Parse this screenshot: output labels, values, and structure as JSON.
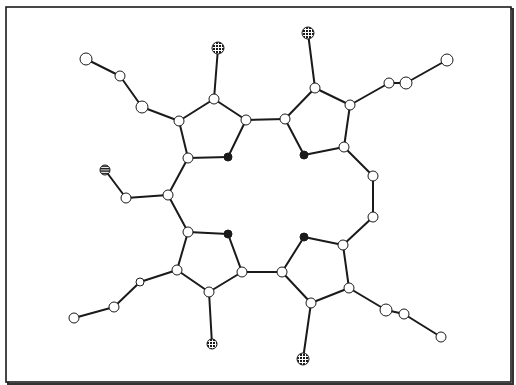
{
  "diagram": {
    "type": "molecular-structure",
    "frame": {
      "x": 6,
      "y": 7,
      "width": 505,
      "height": 375,
      "stroke": "#1a1a1a",
      "shadow": "#333333"
    },
    "styles": {
      "bond_color": "#1a1a1a",
      "bond_width": 2,
      "node_stroke": "#1a1a1a",
      "open_fill": "#ffffff",
      "black_fill": "#1a1a1a",
      "dotted_fill": "#1a1a1a",
      "striped_fill": "#1a1a1a"
    },
    "legend_types": {
      "open": "open-circle atom",
      "black": "solid black atom (nitrogen)",
      "dotted": "dotted/stippled atom",
      "striped": "horizontally striped atom"
    },
    "nodes": [
      {
        "id": "n1",
        "x": 86,
        "y": 59,
        "r": 6,
        "type": "open"
      },
      {
        "id": "n2",
        "x": 120,
        "y": 76,
        "r": 5,
        "type": "open"
      },
      {
        "id": "n3",
        "x": 142,
        "y": 107,
        "r": 6,
        "type": "open"
      },
      {
        "id": "n4",
        "x": 179,
        "y": 121,
        "r": 5,
        "type": "open"
      },
      {
        "id": "n5",
        "x": 214,
        "y": 99,
        "r": 5,
        "type": "open"
      },
      {
        "id": "n6",
        "x": 218,
        "y": 48,
        "r": 6,
        "type": "dotted"
      },
      {
        "id": "n7",
        "x": 246,
        "y": 120,
        "r": 5,
        "type": "open"
      },
      {
        "id": "n8",
        "x": 188,
        "y": 158,
        "r": 5,
        "type": "open"
      },
      {
        "id": "n9",
        "x": 228,
        "y": 157,
        "r": 4,
        "type": "black"
      },
      {
        "id": "n10",
        "x": 308,
        "y": 33,
        "r": 6,
        "type": "dotted"
      },
      {
        "id": "n11",
        "x": 315,
        "y": 88,
        "r": 5,
        "type": "open"
      },
      {
        "id": "n12",
        "x": 350,
        "y": 105,
        "r": 5,
        "type": "open"
      },
      {
        "id": "n13",
        "x": 389,
        "y": 83,
        "r": 5,
        "type": "open"
      },
      {
        "id": "n14",
        "x": 406,
        "y": 83,
        "r": 6,
        "type": "open"
      },
      {
        "id": "n15",
        "x": 447,
        "y": 60,
        "r": 6,
        "type": "open"
      },
      {
        "id": "n16",
        "x": 285,
        "y": 119,
        "r": 5,
        "type": "open"
      },
      {
        "id": "n17",
        "x": 304,
        "y": 155,
        "r": 4,
        "type": "black"
      },
      {
        "id": "n18",
        "x": 344,
        "y": 147,
        "r": 5,
        "type": "open"
      },
      {
        "id": "n19",
        "x": 373,
        "y": 176,
        "r": 5,
        "type": "open"
      },
      {
        "id": "n20",
        "x": 373,
        "y": 217,
        "r": 5,
        "type": "open"
      },
      {
        "id": "n21",
        "x": 105,
        "y": 170,
        "r": 5,
        "type": "striped"
      },
      {
        "id": "n22",
        "x": 126,
        "y": 198,
        "r": 5,
        "type": "open"
      },
      {
        "id": "n23",
        "x": 168,
        "y": 195,
        "r": 5,
        "type": "open"
      },
      {
        "id": "n24",
        "x": 188,
        "y": 232,
        "r": 5,
        "type": "open"
      },
      {
        "id": "n25",
        "x": 228,
        "y": 234,
        "r": 4,
        "type": "black"
      },
      {
        "id": "n26",
        "x": 242,
        "y": 272,
        "r": 5,
        "type": "open"
      },
      {
        "id": "n27",
        "x": 209,
        "y": 292,
        "r": 5,
        "type": "open"
      },
      {
        "id": "n28",
        "x": 177,
        "y": 270,
        "r": 5,
        "type": "open"
      },
      {
        "id": "n29",
        "x": 140,
        "y": 282,
        "r": 4,
        "type": "open"
      },
      {
        "id": "n30",
        "x": 114,
        "y": 307,
        "r": 5,
        "type": "open"
      },
      {
        "id": "n31",
        "x": 74,
        "y": 318,
        "r": 5,
        "type": "open"
      },
      {
        "id": "n32",
        "x": 212,
        "y": 344,
        "r": 5,
        "type": "dotted"
      },
      {
        "id": "n33",
        "x": 304,
        "y": 237,
        "r": 4,
        "type": "black"
      },
      {
        "id": "n34",
        "x": 343,
        "y": 245,
        "r": 5,
        "type": "open"
      },
      {
        "id": "n35",
        "x": 282,
        "y": 272,
        "r": 5,
        "type": "open"
      },
      {
        "id": "n36",
        "x": 311,
        "y": 303,
        "r": 5,
        "type": "open"
      },
      {
        "id": "n37",
        "x": 349,
        "y": 288,
        "r": 5,
        "type": "open"
      },
      {
        "id": "n38",
        "x": 386,
        "y": 310,
        "r": 6,
        "type": "open"
      },
      {
        "id": "n39",
        "x": 404,
        "y": 314,
        "r": 5,
        "type": "open"
      },
      {
        "id": "n40",
        "x": 441,
        "y": 337,
        "r": 5,
        "type": "open"
      },
      {
        "id": "n41",
        "x": 303,
        "y": 359,
        "r": 6,
        "type": "dotted"
      }
    ],
    "bonds": [
      [
        "n1",
        "n2"
      ],
      [
        "n2",
        "n3"
      ],
      [
        "n3",
        "n4"
      ],
      [
        "n4",
        "n5"
      ],
      [
        "n5",
        "n6"
      ],
      [
        "n5",
        "n7"
      ],
      [
        "n7",
        "n9"
      ],
      [
        "n9",
        "n8"
      ],
      [
        "n8",
        "n4"
      ],
      [
        "n7",
        "n16"
      ],
      [
        "n16",
        "n11"
      ],
      [
        "n11",
        "n10"
      ],
      [
        "n11",
        "n12"
      ],
      [
        "n12",
        "n13"
      ],
      [
        "n13",
        "n14"
      ],
      [
        "n14",
        "n15"
      ],
      [
        "n12",
        "n18"
      ],
      [
        "n18",
        "n17"
      ],
      [
        "n17",
        "n16"
      ],
      [
        "n18",
        "n19"
      ],
      [
        "n19",
        "n20"
      ],
      [
        "n20",
        "n34"
      ],
      [
        "n8",
        "n23"
      ],
      [
        "n23",
        "n22"
      ],
      [
        "n22",
        "n21"
      ],
      [
        "n23",
        "n24"
      ],
      [
        "n24",
        "n25"
      ],
      [
        "n25",
        "n26"
      ],
      [
        "n26",
        "n27"
      ],
      [
        "n27",
        "n28"
      ],
      [
        "n28",
        "n24"
      ],
      [
        "n27",
        "n32"
      ],
      [
        "n28",
        "n29"
      ],
      [
        "n29",
        "n30"
      ],
      [
        "n30",
        "n31"
      ],
      [
        "n26",
        "n35"
      ],
      [
        "n35",
        "n33"
      ],
      [
        "n33",
        "n34"
      ],
      [
        "n34",
        "n37"
      ],
      [
        "n37",
        "n36"
      ],
      [
        "n36",
        "n35"
      ],
      [
        "n36",
        "n41"
      ],
      [
        "n37",
        "n38"
      ],
      [
        "n38",
        "n39"
      ],
      [
        "n39",
        "n40"
      ]
    ]
  }
}
